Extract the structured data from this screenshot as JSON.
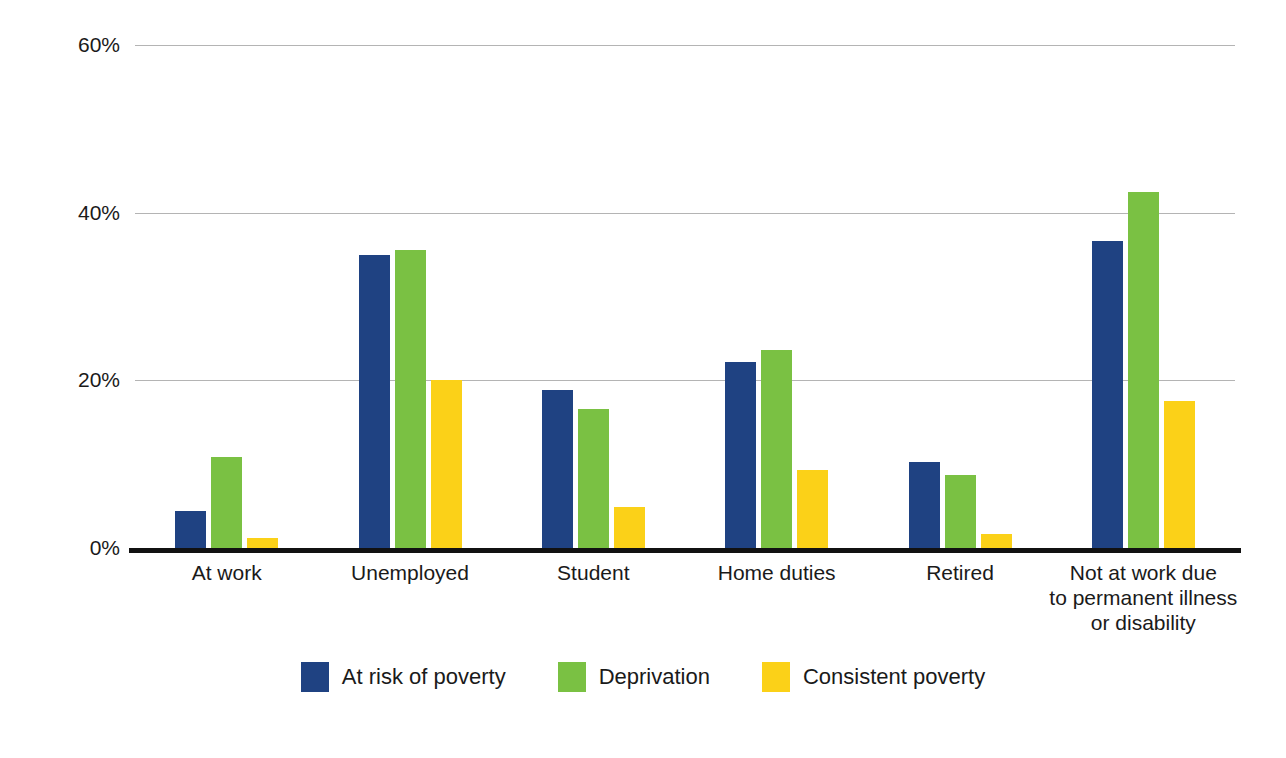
{
  "chart_data": {
    "type": "bar",
    "title": "",
    "subtitle": "",
    "xlabel": "",
    "ylabel": "Percentage of people affected",
    "ylim": [
      0,
      60
    ],
    "yticks": [
      0,
      20,
      40,
      60
    ],
    "ytick_labels": [
      "0%",
      "20%",
      "40%",
      "60%"
    ],
    "grid": true,
    "legend_position": "bottom",
    "categories": [
      "At work",
      "Unemployed",
      "Student",
      "Home duties",
      "Retired",
      "Not at work due\nto permanent illness\nor disability"
    ],
    "category_lines": [
      [
        "At work"
      ],
      [
        "Unemployed"
      ],
      [
        "Student"
      ],
      [
        "Home duties"
      ],
      [
        "Retired"
      ],
      [
        "Not at work due",
        "to permanent illness",
        "or disability"
      ]
    ],
    "series": [
      {
        "name": "At risk of poverty",
        "color": "#1f4282",
        "values": [
          4.4,
          34.9,
          18.9,
          22.2,
          10.3,
          36.6
        ]
      },
      {
        "name": "Deprivation",
        "color": "#7ac143",
        "values": [
          10.8,
          35.5,
          16.6,
          23.6,
          8.7,
          42.5
        ]
      },
      {
        "name": "Consistent poverty",
        "color": "#fbd118",
        "values": [
          1.2,
          20.0,
          4.9,
          9.3,
          1.7,
          17.5
        ]
      }
    ]
  },
  "legend": {
    "items": [
      {
        "label": "At risk of poverty",
        "color": "#1f4282"
      },
      {
        "label": "Deprivation",
        "color": "#7ac143"
      },
      {
        "label": "Consistent poverty",
        "color": "#fbd118"
      }
    ]
  },
  "axis": {
    "y_title": "Percentage of people affected"
  },
  "colors": {
    "series_blue": "#1f4282",
    "series_green": "#7ac143",
    "series_yellow": "#fbd118",
    "gridline": "#b4b4b4",
    "axis": "#111111",
    "text": "#1a1a1a",
    "background": "#ffffff"
  }
}
